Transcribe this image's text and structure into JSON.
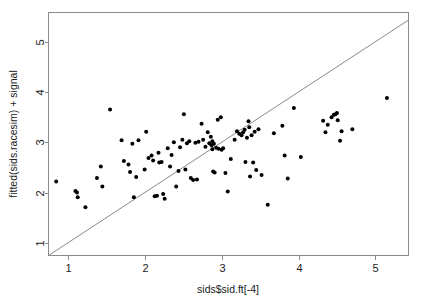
{
  "chart_data": {
    "type": "scatter",
    "title": "",
    "xlabel": "sids$sid.ft[-4]",
    "ylabel": "fitted(sids.racesim) + signal",
    "xlim": [
      0.75,
      5.43
    ],
    "ylim": [
      0.75,
      5.58
    ],
    "xticks": [
      1,
      2,
      3,
      4,
      5
    ],
    "yticks": [
      1,
      2,
      3,
      4,
      5
    ],
    "xtick_labels": [
      "1",
      "2",
      "3",
      "4",
      "5"
    ],
    "ytick_labels": [
      "1",
      "2",
      "3",
      "4",
      "5"
    ],
    "grid": false,
    "legend": null,
    "point_color": "#000000",
    "point_size": 2.0,
    "reference_line": {
      "type": "identity",
      "description": "y = x diagonal line from lower-left to upper-right of plot frame",
      "x": [
        0.75,
        5.43
      ],
      "y": [
        0.75,
        5.43
      ],
      "color": "#7d7d7d"
    },
    "n_points": 108,
    "points": [
      [
        0.85,
        2.22
      ],
      [
        1.1,
        2.03
      ],
      [
        1.12,
        2.0
      ],
      [
        1.13,
        1.91
      ],
      [
        1.23,
        1.71
      ],
      [
        1.38,
        2.29
      ],
      [
        1.43,
        2.52
      ],
      [
        1.45,
        2.12
      ],
      [
        1.55,
        3.65
      ],
      [
        1.7,
        3.04
      ],
      [
        1.73,
        2.63
      ],
      [
        1.79,
        2.56
      ],
      [
        1.81,
        2.41
      ],
      [
        1.84,
        2.97
      ],
      [
        1.86,
        1.91
      ],
      [
        1.89,
        2.31
      ],
      [
        1.92,
        3.04
      ],
      [
        2.0,
        2.46
      ],
      [
        2.02,
        3.21
      ],
      [
        2.05,
        2.69
      ],
      [
        2.09,
        2.74
      ],
      [
        2.11,
        2.64
      ],
      [
        2.13,
        1.93
      ],
      [
        2.16,
        1.94
      ],
      [
        2.18,
        2.79
      ],
      [
        2.19,
        2.6
      ],
      [
        2.22,
        2.61
      ],
      [
        2.24,
        1.97
      ],
      [
        2.26,
        1.88
      ],
      [
        2.3,
        2.88
      ],
      [
        2.33,
        2.52
      ],
      [
        2.35,
        2.75
      ],
      [
        2.38,
        3.0
      ],
      [
        2.41,
        2.12
      ],
      [
        2.44,
        2.43
      ],
      [
        2.46,
        2.9
      ],
      [
        2.49,
        3.05
      ],
      [
        2.51,
        3.56
      ],
      [
        2.53,
        2.46
      ],
      [
        2.55,
        2.98
      ],
      [
        2.58,
        3.02
      ],
      [
        2.6,
        2.29
      ],
      [
        2.63,
        2.25
      ],
      [
        2.66,
        2.99
      ],
      [
        2.68,
        2.26
      ],
      [
        2.7,
        3.01
      ],
      [
        2.74,
        3.37
      ],
      [
        2.76,
        3.05
      ],
      [
        2.79,
        2.91
      ],
      [
        2.82,
        3.2
      ],
      [
        2.84,
        2.98
      ],
      [
        2.86,
        3.11
      ],
      [
        2.87,
        2.94
      ],
      [
        2.88,
        2.86
      ],
      [
        2.88,
        3.02
      ],
      [
        2.89,
        2.42
      ],
      [
        2.9,
        2.97
      ],
      [
        2.91,
        2.4
      ],
      [
        2.93,
        2.89
      ],
      [
        2.95,
        3.45
      ],
      [
        2.96,
        2.87
      ],
      [
        2.99,
        3.5
      ],
      [
        3.0,
        2.85
      ],
      [
        3.02,
        2.88
      ],
      [
        3.05,
        2.39
      ],
      [
        3.08,
        2.02
      ],
      [
        3.12,
        2.67
      ],
      [
        3.17,
        3.05
      ],
      [
        3.2,
        3.22
      ],
      [
        3.23,
        3.17
      ],
      [
        3.26,
        3.14
      ],
      [
        3.28,
        3.2
      ],
      [
        3.3,
        3.25
      ],
      [
        3.31,
        2.61
      ],
      [
        3.33,
        3.09
      ],
      [
        3.35,
        3.42
      ],
      [
        3.36,
        3.3
      ],
      [
        3.37,
        2.32
      ],
      [
        3.39,
        3.14
      ],
      [
        3.41,
        2.6
      ],
      [
        3.43,
        3.21
      ],
      [
        3.45,
        2.45
      ],
      [
        3.48,
        3.26
      ],
      [
        3.52,
        2.35
      ],
      [
        3.6,
        1.76
      ],
      [
        3.68,
        3.18
      ],
      [
        3.79,
        3.33
      ],
      [
        3.82,
        2.74
      ],
      [
        3.86,
        2.28
      ],
      [
        3.94,
        3.68
      ],
      [
        4.03,
        2.71
      ],
      [
        4.32,
        3.43
      ],
      [
        4.35,
        3.2
      ],
      [
        4.38,
        3.35
      ],
      [
        4.43,
        3.5
      ],
      [
        4.46,
        3.55
      ],
      [
        4.48,
        3.56
      ],
      [
        4.5,
        3.58
      ],
      [
        4.51,
        3.44
      ],
      [
        4.54,
        3.03
      ],
      [
        4.56,
        3.22
      ],
      [
        4.7,
        3.26
      ],
      [
        5.15,
        3.88
      ]
    ]
  },
  "axis": {
    "x_title": "sids$sid.ft[-4]",
    "y_title": "fitted(sids.racesim) + signal"
  }
}
